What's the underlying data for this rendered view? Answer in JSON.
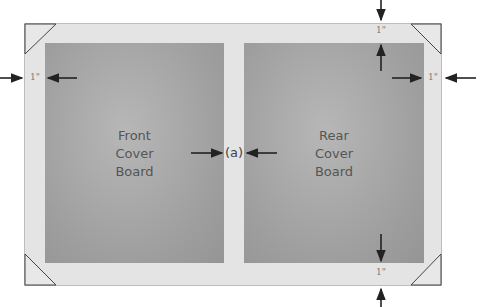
{
  "diagram": {
    "title": "",
    "boards": [
      {
        "id": "front",
        "lines": [
          "Front",
          "Cover",
          "Board"
        ]
      },
      {
        "id": "rear",
        "lines": [
          "Rear",
          "Cover",
          "Board"
        ]
      }
    ],
    "margins": {
      "left": "1\"",
      "top": "1\"",
      "right": "1\"",
      "bottom": "1\""
    },
    "gap_label": "(a)",
    "colors": {
      "sheet": "#e4e4e4",
      "board": "#a8a8a8",
      "arrow": "#222222",
      "text": "#555555"
    }
  }
}
